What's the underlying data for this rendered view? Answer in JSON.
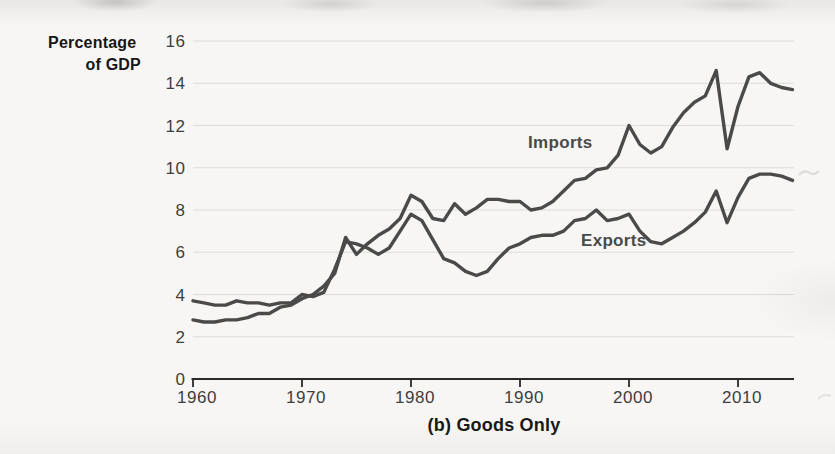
{
  "figure": {
    "y_axis_title_line1": "Percentage",
    "y_axis_title_line2": "of GDP",
    "caption": "(b) Goods Only"
  },
  "chart_data": {
    "type": "line",
    "title": "(b) Goods Only",
    "ylabel": "Percentage of GDP",
    "xlabel": "",
    "grid": "horizontal-only",
    "legend": "inline-labels-on-lines",
    "ylim": [
      0,
      16
    ],
    "x_range": [
      1960,
      2015
    ],
    "y_ticks": [
      0,
      2,
      4,
      6,
      8,
      10,
      12,
      14,
      16
    ],
    "x_ticks": [
      1960,
      1970,
      1980,
      1990,
      2000,
      2010
    ],
    "colors": {
      "line": "#4a4a4a",
      "grid": "#dcdcd7",
      "axis": "#2a2a2a",
      "tick_text": "#3e3e3e",
      "title_text": "#161616"
    },
    "x": [
      1960,
      1961,
      1962,
      1963,
      1964,
      1965,
      1966,
      1967,
      1968,
      1969,
      1970,
      1971,
      1972,
      1973,
      1974,
      1975,
      1976,
      1977,
      1978,
      1979,
      1980,
      1981,
      1982,
      1983,
      1984,
      1985,
      1986,
      1987,
      1988,
      1989,
      1990,
      1991,
      1992,
      1993,
      1994,
      1995,
      1996,
      1997,
      1998,
      1999,
      2000,
      2001,
      2002,
      2003,
      2004,
      2005,
      2006,
      2007,
      2008,
      2009,
      2010,
      2011,
      2012,
      2013,
      2014,
      2015
    ],
    "series": [
      {
        "name": "Imports",
        "label": {
          "year": 1993.7,
          "value": 11.2
        },
        "values": [
          2.8,
          2.7,
          2.7,
          2.8,
          2.8,
          2.9,
          3.1,
          3.1,
          3.4,
          3.5,
          3.8,
          4.0,
          4.4,
          5.0,
          6.7,
          5.9,
          6.4,
          6.8,
          7.1,
          7.6,
          8.7,
          8.4,
          7.6,
          7.5,
          8.3,
          7.8,
          8.1,
          8.5,
          8.5,
          8.4,
          8.4,
          8.0,
          8.1,
          8.4,
          8.9,
          9.4,
          9.5,
          9.9,
          10.0,
          10.6,
          12.0,
          11.1,
          10.7,
          11.0,
          11.9,
          12.6,
          13.1,
          13.4,
          14.6,
          10.9,
          12.9,
          14.3,
          14.5,
          14.0,
          13.8,
          13.7
        ]
      },
      {
        "name": "Exports",
        "label": {
          "year": 1998.6,
          "value": 6.6
        },
        "values": [
          3.7,
          3.6,
          3.5,
          3.5,
          3.7,
          3.6,
          3.6,
          3.5,
          3.6,
          3.6,
          4.0,
          3.9,
          4.1,
          5.2,
          6.5,
          6.4,
          6.2,
          5.9,
          6.2,
          7.0,
          7.8,
          7.5,
          6.6,
          5.7,
          5.5,
          5.1,
          4.9,
          5.1,
          5.7,
          6.2,
          6.4,
          6.7,
          6.8,
          6.8,
          7.0,
          7.5,
          7.6,
          8.0,
          7.5,
          7.6,
          7.8,
          7.0,
          6.5,
          6.4,
          6.7,
          7.0,
          7.4,
          7.9,
          8.9,
          7.4,
          8.6,
          9.5,
          9.7,
          9.7,
          9.6,
          9.4
        ]
      }
    ]
  }
}
